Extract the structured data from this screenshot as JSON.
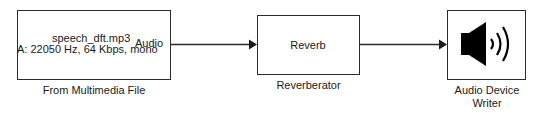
{
  "diagram": {
    "type": "simulink-model",
    "blocks": [
      {
        "id": "from-multimedia-file",
        "name": "From Multimedia File",
        "content_line1": "speech_dft.mp3",
        "content_line2": "A: 22050 Hz, 64 Kbps, mono",
        "output_port_label": "Audio"
      },
      {
        "id": "reverberator",
        "name": "Reverberator",
        "content": "Reverb"
      },
      {
        "id": "audio-device-writer",
        "name_line1": "Audio Device",
        "name_line2": "Writer",
        "icon": "speaker-icon"
      }
    ],
    "connections": [
      {
        "from": "From Multimedia File",
        "to": "Reverberator"
      },
      {
        "from": "Reverberator",
        "to": "Audio Device Writer"
      }
    ],
    "colors": {
      "line": "#2b2b2b",
      "background": "#ffffff",
      "icon": "#000000"
    }
  }
}
